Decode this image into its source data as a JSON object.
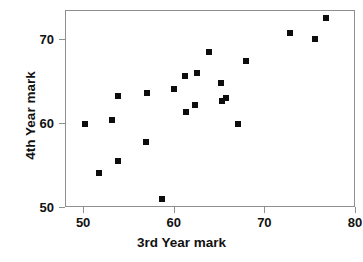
{
  "chart_data": {
    "type": "scatter",
    "title": "",
    "xlabel": "3rd Year mark",
    "ylabel": "4th Year mark",
    "xlim": [
      48,
      80
    ],
    "ylim": [
      50,
      73.5
    ],
    "xticks": [
      50,
      60,
      70,
      80
    ],
    "xtick_labels": [
      "50",
      "60",
      "70",
      "80"
    ],
    "yticks": [
      50,
      60,
      70
    ],
    "ytick_labels": [
      "50",
      "60",
      "70"
    ],
    "grid": false,
    "legend": null,
    "marker": "filled-square",
    "marker_color": "#0d0d0d",
    "points": [
      {
        "x": 50.2,
        "y": 59.9
      },
      {
        "x": 51.8,
        "y": 54.0
      },
      {
        "x": 53.2,
        "y": 60.4
      },
      {
        "x": 53.8,
        "y": 63.3
      },
      {
        "x": 53.9,
        "y": 55.5
      },
      {
        "x": 56.9,
        "y": 57.8
      },
      {
        "x": 57.1,
        "y": 63.6
      },
      {
        "x": 58.7,
        "y": 51.0
      },
      {
        "x": 60.0,
        "y": 64.1
      },
      {
        "x": 61.2,
        "y": 65.6
      },
      {
        "x": 61.3,
        "y": 61.3
      },
      {
        "x": 62.3,
        "y": 62.2
      },
      {
        "x": 62.6,
        "y": 66.0
      },
      {
        "x": 63.9,
        "y": 68.5
      },
      {
        "x": 65.2,
        "y": 64.8
      },
      {
        "x": 65.3,
        "y": 62.7
      },
      {
        "x": 65.8,
        "y": 63.0
      },
      {
        "x": 67.1,
        "y": 59.9
      },
      {
        "x": 68.0,
        "y": 67.4
      },
      {
        "x": 72.8,
        "y": 70.7
      },
      {
        "x": 75.6,
        "y": 70.0
      },
      {
        "x": 76.8,
        "y": 72.6
      }
    ]
  },
  "axes": {
    "frame_color": "#8f8f8f",
    "background": "#ffffff"
  }
}
